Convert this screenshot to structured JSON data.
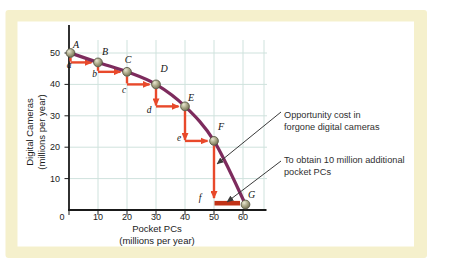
{
  "colors": {
    "page_bg": "#ffffff",
    "card_bg": "#f5f0cc",
    "panel_bg": "#ffffff",
    "grid": "#cfe2dd",
    "axis": "#1a1a1a",
    "curve": "#7d2b5d",
    "arrow_red": "#e8492b",
    "bar_red": "#c23317",
    "leader": "#3a3a3a",
    "text": "#1b1b1b",
    "dot_highlight": "#e9e7d2",
    "dot_mid": "#aaa887",
    "dot_edge": "#5e5c42",
    "dot_outline": "#4f4e3c"
  },
  "chart_data": {
    "type": "line",
    "xlabel_lines": [
      "Pocket PCs",
      "(millions per year)"
    ],
    "ylabel_lines": [
      "Digital Cameras",
      "(millions per year)"
    ],
    "x_ticks": [
      0,
      10,
      20,
      30,
      40,
      50,
      60
    ],
    "y_ticks": [
      10,
      20,
      30,
      40,
      50
    ],
    "origin_label": "0",
    "xlim": [
      0,
      68
    ],
    "ylim": [
      0,
      59
    ],
    "grid": true,
    "series": [
      {
        "name": "production-possibilities-frontier",
        "points": [
          {
            "label": "A",
            "x": 0,
            "y": 50
          },
          {
            "label": "B",
            "x": 10,
            "y": 47
          },
          {
            "label": "C",
            "x": 20,
            "y": 44
          },
          {
            "label": "D",
            "x": 30,
            "y": 40
          },
          {
            "label": "E",
            "x": 40,
            "y": 33
          },
          {
            "label": "F",
            "x": 50,
            "y": 22
          },
          {
            "label": "G",
            "x": 60,
            "y": 0
          }
        ]
      }
    ],
    "steps": [
      {
        "label": "a",
        "from": "A",
        "to": "B",
        "cameras_forgone": 3
      },
      {
        "label": "b",
        "from": "B",
        "to": "C",
        "cameras_forgone": 3
      },
      {
        "label": "c",
        "from": "C",
        "to": "D",
        "cameras_forgone": 4
      },
      {
        "label": "d",
        "from": "D",
        "to": "E",
        "cameras_forgone": 7
      },
      {
        "label": "e",
        "from": "E",
        "to": "F",
        "cameras_forgone": 11
      },
      {
        "label": "f",
        "from": "F",
        "to": "G",
        "cameras_forgone": 22
      }
    ],
    "annotations": [
      {
        "lines": [
          "Opportunity cost in",
          "forgone digital cameras"
        ]
      },
      {
        "lines": [
          "To obtain 10 million additional",
          "pocket PCs"
        ]
      }
    ]
  }
}
